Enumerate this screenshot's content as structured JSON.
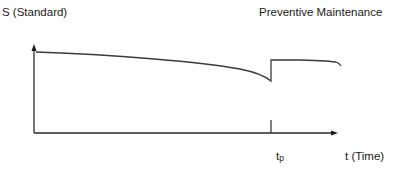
{
  "diagram": {
    "y_axis_label": "S (Standard)",
    "title": "Preventive Maintenance",
    "x_axis_label": "t (Time)",
    "marker_label_main": "t",
    "marker_label_sub": "p",
    "colors": {
      "axis": "#2a2a2a",
      "curve": "#3a3a3a",
      "background": "#ffffff"
    },
    "curve_description": "Performance S declines gradually over time until t_p, where preventive maintenance restores it to a higher level, after which it continues to decline.",
    "events": [
      {
        "name": "preventive-maintenance",
        "at": "t_p"
      }
    ]
  }
}
